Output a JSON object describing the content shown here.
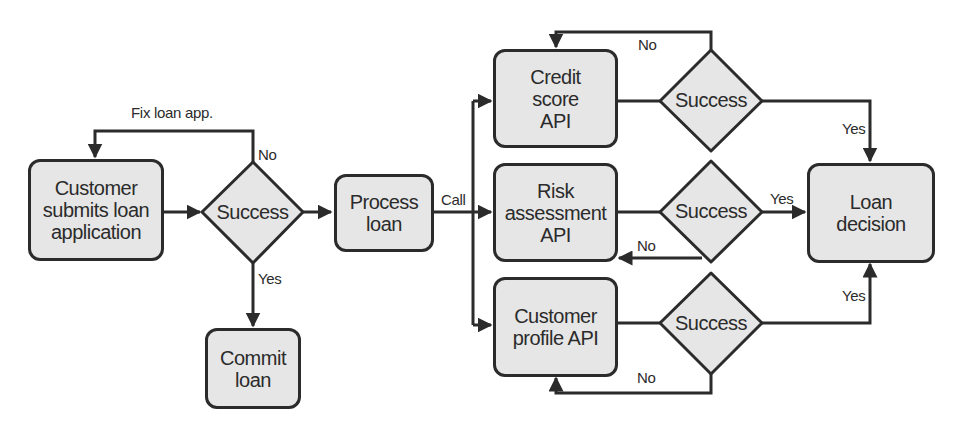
{
  "diagram": {
    "type": "flowchart",
    "colors": {
      "node_fill": "#e6e6e6",
      "stroke": "#2b2b2b",
      "background": "#ffffff"
    },
    "nodes": {
      "customer_submits": {
        "label": "Customer submits loan application",
        "lines": [
          "Customer",
          "submits loan",
          "application"
        ]
      },
      "success_main": {
        "label": "Success"
      },
      "process_loan": {
        "label": "Process loan",
        "lines": [
          "Process",
          "loan"
        ]
      },
      "commit_loan": {
        "label": "Commit loan",
        "lines": [
          "Commit",
          "loan"
        ]
      },
      "credit_score_api": {
        "label": "Credit score API",
        "lines": [
          "Credit",
          "score",
          "API"
        ]
      },
      "risk_assessment_api": {
        "label": "Risk assessment API",
        "lines": [
          "Risk",
          "assessment",
          "API"
        ]
      },
      "customer_profile_api": {
        "label": "Customer profile API",
        "lines": [
          "Customer",
          "profile API"
        ]
      },
      "success_credit": {
        "label": "Success"
      },
      "success_risk": {
        "label": "Success"
      },
      "success_profile": {
        "label": "Success"
      },
      "loan_decision": {
        "label": "Loan decision",
        "lines": [
          "Loan",
          "decision"
        ]
      }
    },
    "edge_labels": {
      "fix_loan_app": "Fix loan app.",
      "main_no": "No",
      "main_yes": "Yes",
      "call": "Call",
      "credit_no": "No",
      "credit_yes": "Yes",
      "risk_no": "No",
      "risk_yes": "Yes",
      "profile_no": "No",
      "profile_yes": "Yes"
    },
    "edges": [
      {
        "from": "Customer submits loan application",
        "to": "Success"
      },
      {
        "from": "Success",
        "to": "Customer submits loan application",
        "label": "No / Fix loan app."
      },
      {
        "from": "Success",
        "to": "Commit loan",
        "label": "Yes"
      },
      {
        "from": "Success",
        "to": "Process loan"
      },
      {
        "from": "Process loan",
        "to": "Credit score API",
        "label": "Call"
      },
      {
        "from": "Process loan",
        "to": "Risk assessment API",
        "label": "Call"
      },
      {
        "from": "Process loan",
        "to": "Customer profile API",
        "label": "Call"
      },
      {
        "from": "Credit score API",
        "to": "Success (credit)"
      },
      {
        "from": "Success (credit)",
        "to": "Credit score API",
        "label": "No"
      },
      {
        "from": "Success (credit)",
        "to": "Loan decision",
        "label": "Yes"
      },
      {
        "from": "Risk assessment API",
        "to": "Success (risk)"
      },
      {
        "from": "Success (risk)",
        "to": "Risk assessment API",
        "label": "No"
      },
      {
        "from": "Success (risk)",
        "to": "Loan decision",
        "label": "Yes"
      },
      {
        "from": "Customer profile API",
        "to": "Success (profile)"
      },
      {
        "from": "Success (profile)",
        "to": "Customer profile API",
        "label": "No"
      },
      {
        "from": "Success (profile)",
        "to": "Loan decision",
        "label": "Yes"
      }
    ]
  }
}
